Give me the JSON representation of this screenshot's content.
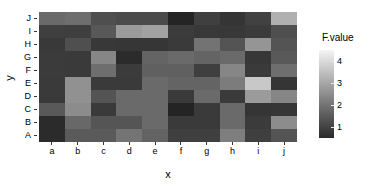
{
  "axes": {
    "x_title": "x",
    "y_title": "y",
    "x_categories": [
      "a",
      "b",
      "c",
      "d",
      "e",
      "f",
      "g",
      "h",
      "i",
      "j"
    ],
    "y_categories_top_to_bottom": [
      "J",
      "I",
      "H",
      "G",
      "F",
      "E",
      "D",
      "C",
      "B",
      "A"
    ]
  },
  "legend": {
    "title": "F.value",
    "ticks": [
      "4",
      "3",
      "2",
      "1"
    ],
    "tick_values": [
      4,
      3,
      2,
      1
    ],
    "low_color": "#2b2b2b",
    "high_color": "#f4f4f4"
  },
  "chart_data": {
    "type": "heatmap",
    "title": "",
    "xlabel": "x",
    "ylabel": "y",
    "legend_title": "F.value",
    "legend_position": "right",
    "grid": false,
    "colorscale": "grayscale-dark-to-light",
    "zlim": [
      0.5,
      4.5
    ],
    "x": [
      "a",
      "b",
      "c",
      "d",
      "e",
      "f",
      "g",
      "h",
      "i",
      "j"
    ],
    "y": [
      "A",
      "B",
      "C",
      "D",
      "E",
      "F",
      "G",
      "H",
      "I",
      "J"
    ],
    "rows_top_to_bottom": [
      "J",
      "I",
      "H",
      "G",
      "F",
      "E",
      "D",
      "C",
      "B",
      "A"
    ],
    "values_top_to_bottom": [
      [
        2.0,
        2.1,
        1.5,
        1.4,
        1.4,
        0.6,
        1.2,
        0.9,
        1.2,
        3.4
      ],
      [
        1.2,
        1.2,
        1.7,
        3.0,
        3.1,
        1.1,
        1.0,
        1.0,
        1.1,
        1.5
      ],
      [
        1.1,
        1.5,
        1.0,
        1.0,
        1.0,
        1.1,
        2.2,
        1.6,
        2.9,
        1.6
      ],
      [
        1.1,
        1.1,
        2.6,
        0.7,
        1.9,
        2.0,
        1.9,
        2.0,
        1.0,
        1.7
      ],
      [
        1.1,
        1.1,
        2.1,
        1.1,
        1.8,
        1.8,
        1.2,
        2.6,
        1.1,
        2.1
      ],
      [
        1.1,
        2.8,
        1.1,
        1.1,
        2.0,
        1.9,
        1.9,
        2.4,
        4.1,
        1.0
      ],
      [
        1.1,
        2.8,
        1.6,
        2.0,
        2.0,
        1.1,
        2.0,
        1.1,
        3.1,
        2.6
      ],
      [
        1.7,
        2.7,
        1.1,
        2.0,
        2.0,
        0.6,
        1.1,
        2.0,
        1.0,
        1.0
      ],
      [
        0.7,
        2.0,
        1.6,
        1.6,
        2.0,
        1.1,
        1.1,
        2.0,
        1.1,
        2.7
      ],
      [
        0.7,
        1.7,
        1.7,
        2.2,
        1.9,
        1.2,
        1.2,
        2.5,
        1.2,
        1.6
      ]
    ],
    "cell_colors_top_to_bottom": [
      [
        "#6a6a6a",
        "#6e6e6e",
        "#4f4f4f",
        "#4b4b4b",
        "#4b4b4b",
        "#242424",
        "#3f3f3f",
        "#353535",
        "#414141",
        "#b0b0b0"
      ],
      [
        "#3f3f3f",
        "#3f3f3f",
        "#585858",
        "#9b9b9b",
        "#a2a2a2",
        "#3b3b3b",
        "#383838",
        "#383838",
        "#3b3b3b",
        "#4f4f4f"
      ],
      [
        "#393939",
        "#4f4f4f",
        "#383838",
        "#363636",
        "#363636",
        "#3a3a3a",
        "#737373",
        "#545454",
        "#959595",
        "#545454"
      ],
      [
        "#3b3b3b",
        "#3a3a3a",
        "#868686",
        "#2b2b2b",
        "#646464",
        "#6a6a6a",
        "#646464",
        "#6a6a6a",
        "#373737",
        "#595959"
      ],
      [
        "#3b3b3b",
        "#3a3a3a",
        "#6e6e6e",
        "#3b3b3b",
        "#606060",
        "#606060",
        "#3f3f3f",
        "#868686",
        "#3a3a3a",
        "#6e6e6e"
      ],
      [
        "#3a3a3a",
        "#919191",
        "#3a3a3a",
        "#3a3a3a",
        "#6a6a6a",
        "#646464",
        "#646464",
        "#7c7c7c",
        "#c8c8c8",
        "#353535"
      ],
      [
        "#3a3a3a",
        "#919191",
        "#545454",
        "#6a6a6a",
        "#6a6a6a",
        "#3a3a3a",
        "#6a6a6a",
        "#3a3a3a",
        "#9b9b9b",
        "#868686"
      ],
      [
        "#595959",
        "#8c8c8c",
        "#3a3a3a",
        "#6a6a6a",
        "#6a6a6a",
        "#242424",
        "#3a3a3a",
        "#6a6a6a",
        "#353535",
        "#363636"
      ],
      [
        "#2b2b2b",
        "#686868",
        "#555555",
        "#555555",
        "#6a6a6a",
        "#3a3a3a",
        "#3a3a3a",
        "#6a6a6a",
        "#3b3b3b",
        "#8c8c8c"
      ],
      [
        "#2b2b2b",
        "#5a5a5a",
        "#5a5a5a",
        "#747474",
        "#636363",
        "#3f3f3f",
        "#3f3f3f",
        "#7e7e7e",
        "#3f3f3f",
        "#545454"
      ]
    ]
  }
}
